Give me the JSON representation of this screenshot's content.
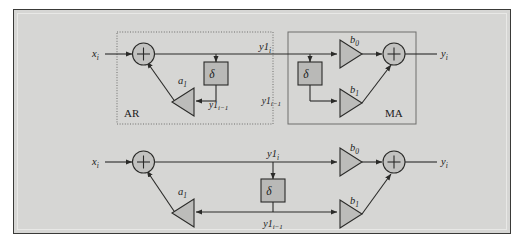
{
  "figure": {
    "type": "signal-flow-diagram",
    "title_visible": false,
    "background_color": "#d6d6d4",
    "frame_border_color": "#3a3a38",
    "line_color": "#2a2a28",
    "block_fill_color": "#b9b9b7",
    "triangle_fill_color": "#bcbcba",
    "summer_fill_color": "#c2c2c0"
  },
  "top_diagram": {
    "ar_block": {
      "label": "AR",
      "border_style": "dotted",
      "input_label": "x",
      "input_sub": "i",
      "summer_symbol": "+",
      "gain_label": "a",
      "gain_sub": "1",
      "delay_symbol": "δ",
      "delay_out_label": "y1",
      "delay_out_sub": "i−1"
    },
    "ma_block": {
      "label": "MA",
      "border_style": "solid",
      "input_label": "y1",
      "input_sub": "i",
      "gain0_label": "b",
      "gain0_sub": "0",
      "gain1_label": "b",
      "gain1_sub": "1",
      "delay_symbol": "δ",
      "delay_out_label": "y1",
      "delay_out_sub": "i−1",
      "summer_symbol": "+",
      "output_label": "y",
      "output_sub": "i"
    }
  },
  "bottom_diagram": {
    "input_label": "x",
    "input_sub": "i",
    "summer_symbol": "+",
    "gain_a_label": "a",
    "gain_a_sub": "1",
    "node_label": "y1",
    "node_sub": "i",
    "delay_symbol": "δ",
    "delay_out_label": "y1",
    "delay_out_sub": "i−1",
    "gain_b0_label": "b",
    "gain_b0_sub": "0",
    "gain_b1_label": "b",
    "gain_b1_sub": "1",
    "output_summer_symbol": "+",
    "output_label": "y",
    "output_sub": "i"
  }
}
